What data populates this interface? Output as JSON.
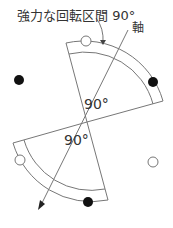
{
  "labels": {
    "title": "強力な回転区間 90°",
    "axis": "軸",
    "angle_upper": "90°",
    "angle_lower": "90°"
  },
  "colors": {
    "line": "#777777",
    "dot_filled": "#111111",
    "dot_open_stroke": "#777777",
    "text": "#333333"
  },
  "diagram": {
    "center": [
      87,
      122
    ],
    "upper_sector": {
      "outer_radius": 82,
      "inner_radius": 70,
      "angle_deg": 90
    },
    "lower_sector": {
      "outer_radius": 82,
      "inner_radius": 70,
      "angle_deg": 90
    },
    "filled_dots": [
      [
        19,
        80
      ],
      [
        153,
        82
      ],
      [
        90,
        202
      ]
    ],
    "open_dots": [
      [
        86,
        40
      ],
      [
        20,
        160
      ],
      [
        153,
        162
      ]
    ]
  }
}
